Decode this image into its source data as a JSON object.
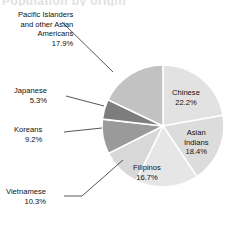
{
  "page": {
    "clipped_title": "Population by origin"
  },
  "chart_data": {
    "type": "pie",
    "title": "",
    "start_angle_deg": 0,
    "direction": "clockwise",
    "categories": [
      "Chinese",
      "Asian Indians",
      "Filipinos",
      "Vietnamese",
      "Koreans",
      "Japanese",
      "Pacific Islanders and other  Asian Americans"
    ],
    "values": [
      22.2,
      18.4,
      16.7,
      10.3,
      9.2,
      5.3,
      17.9
    ],
    "value_suffix": "%",
    "slices": [
      {
        "name": "Chinese",
        "label": "Chinese",
        "value": 22.2,
        "value_text": "22.2%",
        "color": "#e2e2e2",
        "label_placement": "inside"
      },
      {
        "name": "Asian Indians",
        "label_line1": "Asian",
        "label_line2": "Indians",
        "value": 18.4,
        "value_text": "18.4%",
        "color": "#dcdcdc",
        "label_placement": "inside"
      },
      {
        "name": "Filipinos",
        "label": "Filipinos",
        "value": 16.7,
        "value_text": "16.7%",
        "color": "#e6e6e6",
        "label_placement": "inside"
      },
      {
        "name": "Vietnamese",
        "label": "Vietnamese",
        "value": 10.3,
        "value_text": "10.3%",
        "color": "#d8d8d8",
        "label_placement": "outside-left"
      },
      {
        "name": "Koreans",
        "label": "Koreans",
        "value": 9.2,
        "value_text": "9.2%",
        "color": "#9a9a9a",
        "label_placement": "outside-left"
      },
      {
        "name": "Japanese",
        "label": "Japanese",
        "value": 5.3,
        "value_text": "5.3%",
        "color": "#7d7d7d",
        "label_placement": "outside-left"
      },
      {
        "name": "Pacific Islanders and other Asian Americans",
        "label_line1": "Pacific Islanders",
        "label_line2": "and other  Asian",
        "label_line3": "Americans",
        "value": 17.9,
        "value_text": "17.9%",
        "color": "#c2c2c2",
        "label_placement": "outside-top-left"
      }
    ],
    "legend": "none",
    "grid": false,
    "geometry": {
      "center_x": 163,
      "center_y": 126,
      "radius": 61,
      "separator_color": "#ffffff"
    },
    "leader_lines": [
      {
        "name": "pacific-leader",
        "x1": 62,
        "y1": 22,
        "x2": 113,
        "y2": 72
      },
      {
        "name": "japanese-leader",
        "x1": 66,
        "y1": 96,
        "x2": 104,
        "y2": 106
      },
      {
        "name": "koreans-leader",
        "x1": 64,
        "y1": 132,
        "x2": 102,
        "y2": 128
      },
      {
        "name": "vietnamese-leader",
        "x1": 64,
        "y1": 196,
        "x2": 82,
        "y2": 196
      },
      {
        "name": "vietnamese-leader-2",
        "x1": 82,
        "y1": 196,
        "x2": 123,
        "y2": 160
      }
    ]
  }
}
